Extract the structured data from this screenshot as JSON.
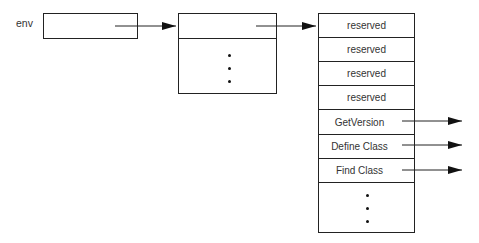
{
  "diagram": {
    "env_label": "env",
    "function_table": {
      "rows": [
        {
          "label": "reserved"
        },
        {
          "label": "reserved"
        },
        {
          "label": "reserved"
        },
        {
          "label": "reserved"
        },
        {
          "label": "GetVersion"
        },
        {
          "label": "Define Class"
        },
        {
          "label": "Find Class"
        }
      ],
      "continuation": "⋮"
    },
    "pointer_box": {
      "continuation": "⋮"
    }
  }
}
